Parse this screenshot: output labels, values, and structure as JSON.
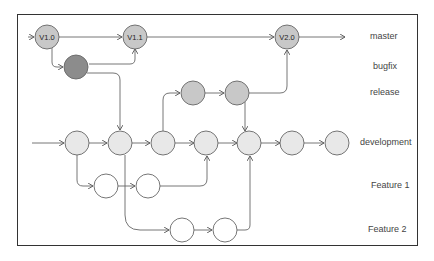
{
  "diagram": {
    "colors": {
      "master_node": "#c8c8c8",
      "bugfix_node": "#8c8c8c",
      "release_node": "#c8c8c8",
      "development_node": "#e8e8e8",
      "feature_node": "#ffffff",
      "stroke": "#555555"
    },
    "branches": [
      {
        "id": "master",
        "label": "master"
      },
      {
        "id": "bugfix",
        "label": "bugfix"
      },
      {
        "id": "release",
        "label": "release"
      },
      {
        "id": "development",
        "label": "development"
      },
      {
        "id": "feature1",
        "label": "Feature 1"
      },
      {
        "id": "feature2",
        "label": "Feature 2"
      }
    ],
    "nodes": [
      {
        "id": "m1",
        "branch": "master",
        "label": "V1.0"
      },
      {
        "id": "m2",
        "branch": "master",
        "label": "V1.1"
      },
      {
        "id": "m3",
        "branch": "master",
        "label": "V2.0"
      },
      {
        "id": "b1",
        "branch": "bugfix",
        "label": ""
      },
      {
        "id": "r1",
        "branch": "release",
        "label": ""
      },
      {
        "id": "r2",
        "branch": "release",
        "label": ""
      },
      {
        "id": "d1",
        "branch": "development",
        "label": ""
      },
      {
        "id": "d2",
        "branch": "development",
        "label": ""
      },
      {
        "id": "d3",
        "branch": "development",
        "label": ""
      },
      {
        "id": "d4",
        "branch": "development",
        "label": ""
      },
      {
        "id": "d5",
        "branch": "development",
        "label": ""
      },
      {
        "id": "d6",
        "branch": "development",
        "label": ""
      },
      {
        "id": "d7",
        "branch": "development",
        "label": ""
      },
      {
        "id": "f1a",
        "branch": "feature1",
        "label": ""
      },
      {
        "id": "f1b",
        "branch": "feature1",
        "label": ""
      },
      {
        "id": "f2a",
        "branch": "feature2",
        "label": ""
      },
      {
        "id": "f2b",
        "branch": "feature2",
        "label": ""
      }
    ],
    "edges": [
      [
        "start-master",
        "m1"
      ],
      [
        "m1",
        "m2"
      ],
      [
        "m2",
        "m3"
      ],
      [
        "m3",
        "end-master"
      ],
      [
        "m1",
        "b1"
      ],
      [
        "b1",
        "m2"
      ],
      [
        "b1",
        "d2"
      ],
      [
        "start-dev",
        "d1"
      ],
      [
        "d1",
        "d2"
      ],
      [
        "d2",
        "d3"
      ],
      [
        "d3",
        "d4"
      ],
      [
        "d4",
        "d5"
      ],
      [
        "d5",
        "d6"
      ],
      [
        "d6",
        "d7"
      ],
      [
        "d3",
        "r1"
      ],
      [
        "r1",
        "r2"
      ],
      [
        "r2",
        "m3"
      ],
      [
        "r2",
        "d5"
      ],
      [
        "d1",
        "f1a"
      ],
      [
        "f1a",
        "f1b"
      ],
      [
        "f1b",
        "d4"
      ],
      [
        "d2",
        "f2a"
      ],
      [
        "f2a",
        "f2b"
      ],
      [
        "f2b",
        "d5"
      ]
    ]
  }
}
